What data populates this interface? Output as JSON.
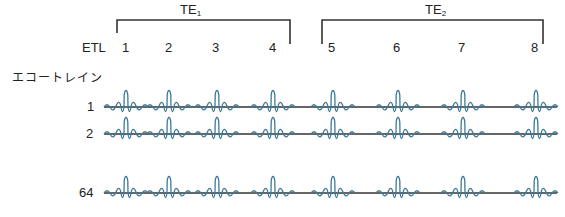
{
  "groups": [
    {
      "label": "TE",
      "subscript": "1",
      "echoes": [
        "1",
        "2",
        "3",
        "4"
      ]
    },
    {
      "label": "TE",
      "subscript": "2",
      "echoes": [
        "5",
        "6",
        "7",
        "8"
      ]
    }
  ],
  "etl_label": "ETL",
  "echo_train_label": "エコートレイン",
  "rows": [
    {
      "label": "1"
    },
    {
      "label": "2"
    },
    {
      "label": "64"
    }
  ],
  "colors": {
    "signal": "#3c7a9c",
    "baseline": "#333333",
    "bracket": "#333333"
  }
}
